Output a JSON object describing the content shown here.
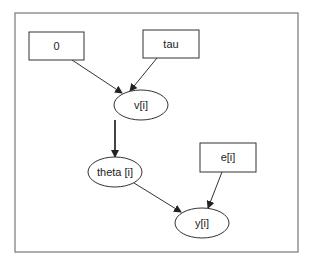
{
  "diagram": {
    "type": "directed-acyclic-graph",
    "frame": {
      "x": 15,
      "y": 13,
      "width": 283,
      "height": 239,
      "stroke": "#777777"
    },
    "nodes": [
      {
        "id": "zero",
        "label": "0",
        "shape": "box",
        "x": 29,
        "y": 32,
        "w": 55,
        "h": 28
      },
      {
        "id": "tau",
        "label": "tau",
        "shape": "box",
        "x": 143,
        "y": 30,
        "w": 56,
        "h": 28
      },
      {
        "id": "v",
        "label": "v[i]",
        "shape": "ellipse",
        "cx": 141,
        "cy": 105,
        "rx": 27,
        "ry": 15
      },
      {
        "id": "theta",
        "label": "theta [i]",
        "shape": "ellipse",
        "cx": 115,
        "cy": 172,
        "rx": 27,
        "ry": 15
      },
      {
        "id": "e",
        "label": "e[i]",
        "shape": "box",
        "x": 200,
        "y": 143,
        "w": 56,
        "h": 29
      },
      {
        "id": "y",
        "label": "y[i]",
        "shape": "ellipse",
        "cx": 202,
        "cy": 223,
        "rx": 27,
        "ry": 15
      }
    ],
    "edges": [
      {
        "from": "zero",
        "to": "v",
        "style": "thin"
      },
      {
        "from": "tau",
        "to": "v",
        "style": "thin"
      },
      {
        "from": "v",
        "to": "theta",
        "style": "thick"
      },
      {
        "from": "theta",
        "to": "y",
        "style": "thin"
      },
      {
        "from": "e",
        "to": "y",
        "style": "thin"
      }
    ]
  }
}
